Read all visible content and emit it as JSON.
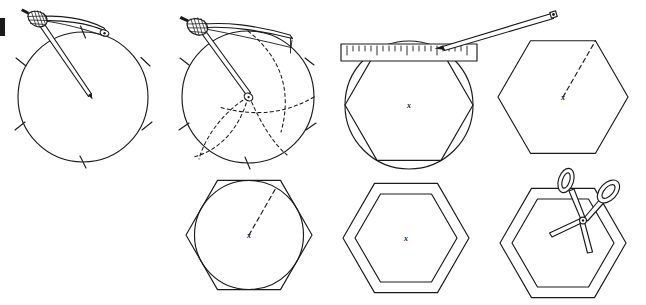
{
  "figure": {
    "background_color": "#ffffff",
    "ink_color": "#1a1a1a",
    "width": 646,
    "height": 305,
    "center_mark_label": "x"
  },
  "panels": [
    {
      "id": "panel-1",
      "step_number": "1",
      "caption": "Draw a circle with the compass and step the radius around the rim",
      "tools": [
        "compass"
      ],
      "shapes": [
        "circle",
        "tick-marks"
      ],
      "tick_count": 6,
      "circle": {
        "cx": 83,
        "cy": 97,
        "r": 65
      }
    },
    {
      "id": "panel-2",
      "step_number": "2",
      "caption": "Swing arcs from each rim point to divide the circle into six",
      "tools": [
        "compass"
      ],
      "shapes": [
        "circle",
        "dashed-arcs",
        "tick-marks"
      ],
      "arc_count": 3,
      "circle": {
        "cx": 248,
        "cy": 97,
        "r": 66
      }
    },
    {
      "id": "panel-3",
      "step_number": "3",
      "caption": "Join the marks with a ruler and pencil to form the hexagon",
      "tools": [
        "ruler",
        "pencil"
      ],
      "shapes": [
        "circle",
        "hexagon",
        "ruler",
        "pencil"
      ],
      "circle": {
        "cx": 409,
        "cy": 105,
        "r": 64
      }
    },
    {
      "id": "panel-4",
      "step_number": "4",
      "caption": "The finished hexagon with a radius marked to one corner",
      "tools": [],
      "shapes": [
        "hexagon",
        "dashed-radius",
        "center-mark"
      ],
      "hexagon": {
        "cx": 563,
        "cy": 97,
        "r": 65
      }
    },
    {
      "id": "panel-5",
      "step_number": "5",
      "caption": "Draw an inscribed circle touching the hexagon sides",
      "tools": [],
      "shapes": [
        "hexagon",
        "inscribed-circle",
        "dashed-radius",
        "center-mark"
      ],
      "hexagon": {
        "cx": 249,
        "cy": 235,
        "r": 63
      }
    },
    {
      "id": "panel-6",
      "step_number": "6",
      "caption": "Draw a smaller hexagon inside to make a border",
      "tools": [],
      "shapes": [
        "hexagon-outer",
        "hexagon-inner",
        "center-mark"
      ],
      "hexagon": {
        "cx": 406,
        "cy": 238,
        "r": 63
      }
    },
    {
      "id": "panel-7",
      "step_number": "7",
      "caption": "Cut out the hexagonal ring with scissors",
      "tools": [
        "scissors"
      ],
      "shapes": [
        "hexagon-outer",
        "hexagon-inner",
        "scissors"
      ],
      "hexagon": {
        "cx": 563,
        "cy": 243,
        "r": 63
      }
    }
  ],
  "tools": {
    "compass": {
      "name": "compass",
      "parts": [
        "knurled-head",
        "needle-leg",
        "pencil-leg"
      ]
    },
    "ruler": {
      "name": "ruler",
      "tick_marks": 21,
      "long_tick_interval": 5
    },
    "pencil": {
      "name": "pencil",
      "parts": [
        "shaft",
        "tip",
        "end-cap"
      ]
    },
    "scissors": {
      "name": "scissors",
      "parts": [
        "loop-handle-left",
        "loop-handle-right",
        "blade-left",
        "blade-right",
        "pivot-rivet"
      ]
    }
  }
}
